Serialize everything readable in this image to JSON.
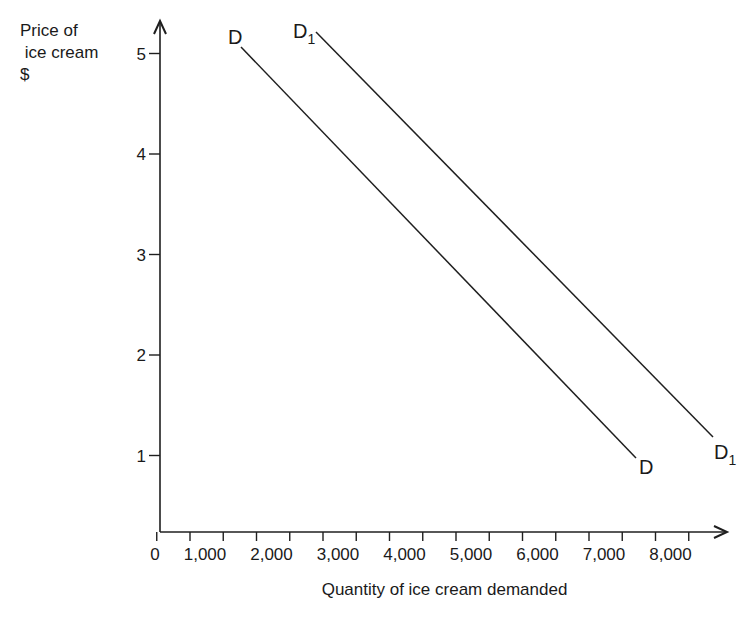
{
  "chart_data": {
    "type": "line",
    "title": "",
    "ylabel_lines": [
      "Price of",
      " ice cream",
      "$"
    ],
    "xlabel": "Quantity of ice cream demanded",
    "y_ticks": [
      {
        "value": 5,
        "label": "5"
      },
      {
        "value": 4,
        "label": "4"
      },
      {
        "value": 3,
        "label": "3"
      },
      {
        "value": 2,
        "label": "2"
      },
      {
        "value": 1,
        "label": "1"
      }
    ],
    "x_ticks": [
      {
        "value": 0,
        "label": "0"
      },
      {
        "value": 1000,
        "label": "1,000"
      },
      {
        "value": 2000,
        "label": "2,000"
      },
      {
        "value": 3000,
        "label": "3,000"
      },
      {
        "value": 4000,
        "label": "4,000"
      },
      {
        "value": 5000,
        "label": "5,000"
      },
      {
        "value": 6000,
        "label": "6,000"
      },
      {
        "value": 7000,
        "label": "7,000"
      },
      {
        "value": 8000,
        "label": "8,000"
      }
    ],
    "xlim": [
      0,
      8500
    ],
    "ylim": [
      0,
      5.3
    ],
    "grid": false,
    "legend": "none (curves labeled directly at ends)",
    "series": [
      {
        "name": "D",
        "label_main": "D",
        "label_sub": "",
        "points": [
          {
            "x": 1500,
            "y": 5.0
          },
          {
            "x": 7500,
            "y": 1.0
          }
        ]
      },
      {
        "name": "D1",
        "label_main": "D",
        "label_sub": "1",
        "points": [
          {
            "x": 2500,
            "y": 5.2
          },
          {
            "x": 8500,
            "y": 1.2
          }
        ]
      }
    ]
  },
  "caption": {
    "text": ""
  }
}
